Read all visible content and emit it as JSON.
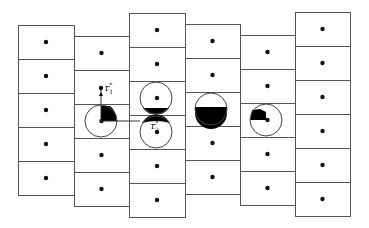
{
  "figure": {
    "type": "particle-cell diagram",
    "width": 369,
    "height": 228,
    "colors": {
      "line": "#555555",
      "dot": "#111111",
      "fill": "#000000",
      "background": "#ffffff"
    }
  },
  "columns": [
    {
      "id": 1,
      "x": 18,
      "width": 56,
      "top": 25,
      "rows": 5,
      "row_height": 34
    },
    {
      "id": 2,
      "x": 74,
      "width": 55,
      "top": 36,
      "rows": 5,
      "row_height": 34
    },
    {
      "id": 3,
      "x": 129,
      "width": 56,
      "top": 13,
      "rows": 6,
      "row_height": 34
    },
    {
      "id": 4,
      "x": 185,
      "width": 55,
      "top": 24,
      "rows": 5,
      "row_height": 34
    },
    {
      "id": 5,
      "x": 240,
      "width": 55,
      "top": 35,
      "rows": 5,
      "row_height": 34
    },
    {
      "id": 6,
      "x": 295,
      "width": 55,
      "top": 12,
      "rows": 6,
      "row_height": 34
    }
  ],
  "circles": [
    {
      "id": "c1",
      "cx": 101,
      "cy": 121,
      "r": 16,
      "fill_shape": "upper-right sector"
    },
    {
      "id": "c2",
      "cx": 156,
      "cy": 98,
      "r": 16,
      "fill_shape": "bottom segment"
    },
    {
      "id": "c3",
      "cx": 156,
      "cy": 132,
      "r": 16,
      "fill_shape": "top segment"
    },
    {
      "id": "c4",
      "cx": 211,
      "cy": 109,
      "r": 16,
      "fill_shape": "lower half"
    },
    {
      "id": "c5",
      "cx": 266,
      "cy": 120,
      "r": 16,
      "fill_shape": "upper-left sector"
    }
  ],
  "labels": {
    "r1": {
      "base": "r",
      "sup": "*",
      "sub": "1",
      "x": 105,
      "y": 88
    },
    "r2": {
      "base": "r",
      "sup": "*",
      "sub": "2",
      "x": 150,
      "y": 130
    }
  },
  "connectors": [
    {
      "from": [
        101,
        88
      ],
      "to": [
        101,
        121
      ],
      "kind": "vertical arrow"
    },
    {
      "from": [
        101,
        121
      ],
      "to": [
        140,
        121
      ],
      "kind": "horizontal line"
    }
  ]
}
